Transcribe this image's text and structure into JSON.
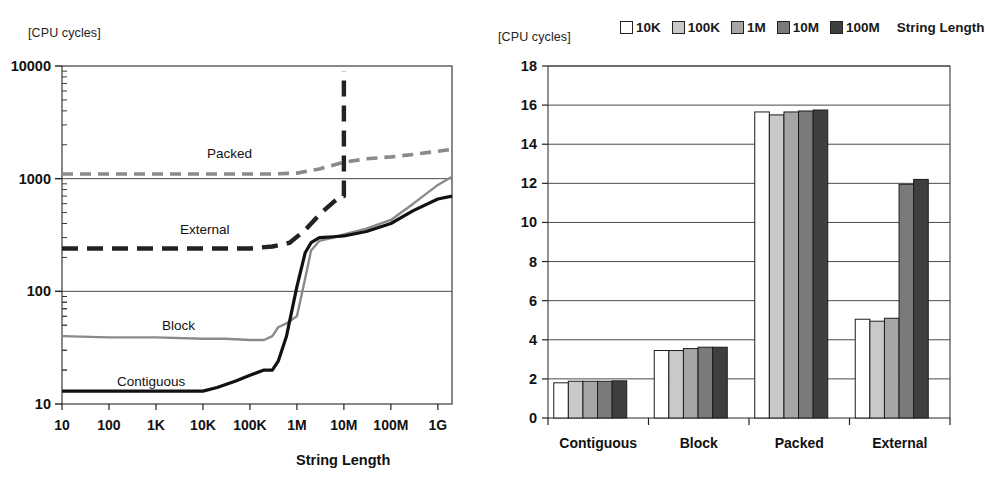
{
  "figure": {
    "panels": [
      "line-chart-string-access-cost",
      "bar-chart-string-access-cost"
    ]
  },
  "left": {
    "unit_label": "[CPU cycles]",
    "x_axis_title": "String Length",
    "y_ticks": [
      "10",
      "100",
      "1000",
      "10000"
    ],
    "x_ticks": [
      "10",
      "100",
      "1K",
      "10K",
      "100K",
      "1M",
      "10M",
      "100M",
      "1G"
    ],
    "series_labels": [
      "Packed",
      "External",
      "Block",
      "Contiguous"
    ],
    "chart_data": {
      "type": "line",
      "title": "",
      "xlabel": "String Length",
      "ylabel": "[CPU cycles]",
      "xscale": "log",
      "yscale": "log",
      "xlim": [
        10,
        2000000000
      ],
      "ylim": [
        10,
        10000
      ],
      "grid": true,
      "x_tick_labels": [
        "10",
        "100",
        "1K",
        "10K",
        "100K",
        "1M",
        "10M",
        "100M",
        "1G"
      ],
      "x_tick_values": [
        10,
        100,
        1000,
        10000,
        100000,
        1000000,
        10000000,
        100000000,
        1000000000
      ],
      "y_tick_labels": [
        "10",
        "100",
        "1000",
        "10000"
      ],
      "y_tick_values": [
        10,
        100,
        1000,
        10000
      ],
      "series": [
        {
          "name": "Packed",
          "style": "dashed",
          "color": "#8a8a8a",
          "x": [
            10,
            100,
            1000,
            10000,
            100000,
            300000,
            1000000,
            3000000,
            10000000,
            30000000,
            100000000,
            300000000,
            1000000000,
            2000000000
          ],
          "values": [
            1100,
            1100,
            1100,
            1100,
            1100,
            1100,
            1120,
            1220,
            1400,
            1500,
            1560,
            1640,
            1750,
            1820
          ]
        },
        {
          "name": "External",
          "style": "dashed",
          "color": "#222222",
          "x": [
            10,
            100,
            1000,
            10000,
            100000,
            300000,
            700000,
            1500000,
            3000000,
            6000000,
            9000000,
            10000000,
            10000000
          ],
          "values": [
            240,
            240,
            240,
            240,
            240,
            250,
            270,
            350,
            480,
            620,
            700,
            700,
            9000
          ]
        },
        {
          "name": "Block",
          "style": "solid",
          "color": "#8a8a8a",
          "x": [
            10,
            100,
            1000,
            10000,
            30000,
            100000,
            200000,
            300000,
            400000,
            600000,
            1000000,
            1500000,
            2000000,
            3000000,
            6000000,
            10000000,
            30000000,
            100000000,
            300000000,
            1000000000,
            2000000000
          ],
          "values": [
            40,
            39,
            39,
            38,
            38,
            37,
            37,
            40,
            48,
            52,
            60,
            130,
            230,
            280,
            300,
            320,
            360,
            430,
            600,
            880,
            1040
          ]
        },
        {
          "name": "Contiguous",
          "style": "solid",
          "color": "#111111",
          "x": [
            10,
            100,
            1000,
            10000,
            20000,
            50000,
            100000,
            200000,
            300000,
            400000,
            600000,
            1000000,
            1500000,
            2000000,
            3000000,
            6000000,
            10000000,
            30000000,
            100000000,
            300000000,
            1000000000,
            2000000000
          ],
          "values": [
            13,
            13,
            13,
            13,
            14,
            16,
            18,
            20,
            20,
            24,
            40,
            110,
            220,
            270,
            300,
            305,
            310,
            340,
            400,
            520,
            660,
            700
          ]
        }
      ]
    }
  },
  "right": {
    "unit_label": "[CPU cycles]",
    "legend_title": "String Length",
    "legend_items": [
      {
        "label": "10K",
        "color": "#ffffff"
      },
      {
        "label": "100K",
        "color": "#c9c9c9"
      },
      {
        "label": "1M",
        "color": "#a6a6a6"
      },
      {
        "label": "10M",
        "color": "#7a7a7a"
      },
      {
        "label": "100M",
        "color": "#3f3f3f"
      }
    ],
    "y_ticks": [
      "0",
      "2",
      "4",
      "6",
      "8",
      "10",
      "12",
      "14",
      "16",
      "18"
    ],
    "categories": [
      "Contiguous",
      "Block",
      "Packed",
      "External"
    ],
    "chart_data": {
      "type": "bar",
      "title": "",
      "xlabel": "",
      "ylabel": "[CPU cycles]",
      "ylim": [
        0,
        18
      ],
      "ytick_step": 2,
      "grid": true,
      "legend_position": "top",
      "legend_title": "String Length",
      "categories": [
        "Contiguous",
        "Block",
        "Packed",
        "External"
      ],
      "series": [
        {
          "name": "10K",
          "color": "#ffffff",
          "values": [
            1.8,
            3.45,
            15.65,
            5.05
          ]
        },
        {
          "name": "100K",
          "color": "#c9c9c9",
          "values": [
            1.88,
            3.45,
            15.5,
            4.95
          ]
        },
        {
          "name": "1M",
          "color": "#a6a6a6",
          "values": [
            1.88,
            3.55,
            15.65,
            5.1
          ]
        },
        {
          "name": "10M",
          "color": "#7a7a7a",
          "values": [
            1.88,
            3.62,
            15.7,
            11.95
          ]
        },
        {
          "name": "100M",
          "color": "#3f3f3f",
          "values": [
            1.9,
            3.62,
            15.75,
            12.2
          ]
        }
      ]
    }
  }
}
